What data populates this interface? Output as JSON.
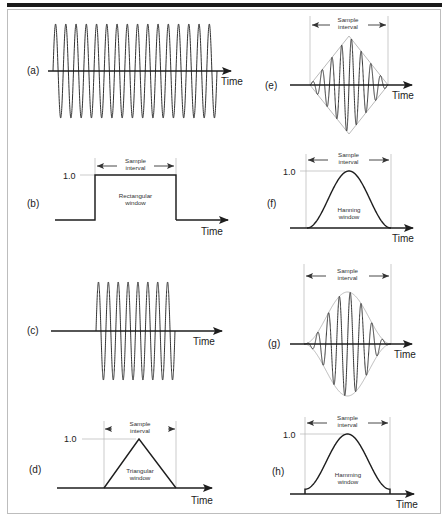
{
  "figure": {
    "panels": [
      {
        "id": "a",
        "label": "(a)",
        "kind": "continuous-sine",
        "cycles": 16,
        "axis_label": "Time"
      },
      {
        "id": "b",
        "label": "(b)",
        "kind": "rectangular-window",
        "window_name": "Rectangular window",
        "window_line1": "Rectangular",
        "window_line2": "window",
        "peak_label": "1.0",
        "interval_line1": "Sample",
        "interval_line2": "interval",
        "axis_label": "Time"
      },
      {
        "id": "c",
        "label": "(c)",
        "kind": "rect-windowed-sine",
        "cycles": 8,
        "axis_label": "Time"
      },
      {
        "id": "d",
        "label": "(d)",
        "kind": "triangular-window",
        "window_name": "Triangular window",
        "window_line1": "Triangular",
        "window_line2": "window",
        "peak_label": "1.0",
        "interval_line1": "Sample",
        "interval_line2": "interval",
        "axis_label": "Time"
      },
      {
        "id": "e",
        "label": "(e)",
        "kind": "triangular-windowed-sine",
        "cycles": 8,
        "interval_line1": "Sample",
        "interval_line2": "interval",
        "axis_label": "Time"
      },
      {
        "id": "f",
        "label": "(f)",
        "kind": "hanning-window",
        "window_name": "Hanning window",
        "window_line1": "Hanning",
        "window_line2": "window",
        "peak_label": "1.0",
        "interval_line1": "Sample",
        "interval_line2": "interval",
        "axis_label": "Time"
      },
      {
        "id": "g",
        "label": "(g)",
        "kind": "hanning-windowed-sine",
        "cycles": 8,
        "interval_line1": "Sample",
        "interval_line2": "interval",
        "axis_label": "Time"
      },
      {
        "id": "h",
        "label": "(h)",
        "kind": "hamming-window",
        "window_name": "Hamming window",
        "window_line1": "Hamming",
        "window_line2": "window",
        "peak_label": "1.0",
        "interval_line1": "Sample",
        "interval_line2": "interval",
        "axis_label": "Time"
      }
    ]
  },
  "colors": {
    "stroke": "#1e1e1e",
    "guide": "#b5b5b5",
    "envelope": "#a8a8a8"
  }
}
